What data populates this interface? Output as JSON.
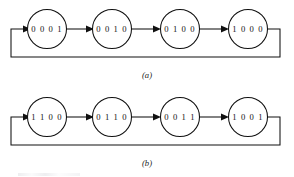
{
  "figure": {
    "background_color": "#ffffff",
    "line_color": "#111111",
    "node_fill": "#ffffff"
  },
  "diagrams": [
    {
      "id": "diagram-a",
      "caption": "(a)",
      "type": "state-sequence-ring",
      "feedback": "last-to-first",
      "states": [
        {
          "label": "0 0 0 1",
          "value": "0001"
        },
        {
          "label": "0 0 1 0",
          "value": "0010"
        },
        {
          "label": "0 1 0 0",
          "value": "0100"
        },
        {
          "label": "1 0 0 0",
          "value": "1000"
        }
      ]
    },
    {
      "id": "diagram-b",
      "caption": "(b)",
      "type": "state-sequence-ring",
      "feedback": "last-to-first",
      "states": [
        {
          "label": "1 1 0 0",
          "value": "1100"
        },
        {
          "label": "0 1 1 0",
          "value": "0110"
        },
        {
          "label": "0 0 1 1",
          "value": "0011"
        },
        {
          "label": "1 0 0 1",
          "value": "1001"
        }
      ]
    }
  ]
}
